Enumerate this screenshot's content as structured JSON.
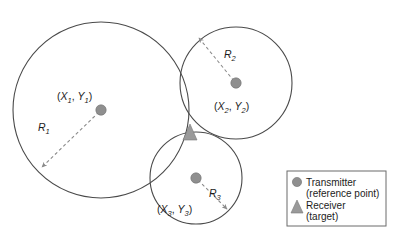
{
  "figure": {
    "background_color": "#ffffff",
    "circle_stroke_color": "#4a4a4a",
    "dashed_line_color": "#8a8a8a",
    "transmitter_marker_color": "#8f8f8f",
    "receiver_marker_color": "#9a9a9a",
    "text_color": "#1c1c1c"
  },
  "circles": [
    {
      "id": "circle-1",
      "center_label_open": "(",
      "center_label_x": "X",
      "center_label_x_sub": "1",
      "center_label_comma": ", ",
      "center_label_y": "Y",
      "center_label_y_sub": "1",
      "center_label_close": ")",
      "radius_label": "R",
      "radius_label_sub": "1",
      "cx": 101,
      "cy": 110,
      "r": 88
    },
    {
      "id": "circle-2",
      "center_label_open": "(",
      "center_label_x": "X",
      "center_label_x_sub": "2",
      "center_label_comma": ", ",
      "center_label_y": "Y",
      "center_label_y_sub": "2",
      "center_label_close": ")",
      "radius_label": "R",
      "radius_label_sub": "2",
      "cx": 236,
      "cy": 83,
      "r": 56
    },
    {
      "id": "circle-3",
      "center_label_open": "(",
      "center_label_x": "X",
      "center_label_x_sub": "3",
      "center_label_comma": ", ",
      "center_label_y": "Y",
      "center_label_y_sub": "3",
      "center_label_close": ")",
      "radius_label": "R",
      "radius_label_sub": "3",
      "cx": 196,
      "cy": 178,
      "r": 46
    }
  ],
  "receiver": {
    "id": "receiver-marker",
    "x": 190,
    "y": 133
  },
  "legend": {
    "items": [
      {
        "marker": "circle-marker",
        "line1": "Transmitter",
        "line2": "(reference point)"
      },
      {
        "marker": "triangle-marker",
        "line1": "Receiver",
        "line2": "(target)"
      }
    ]
  }
}
